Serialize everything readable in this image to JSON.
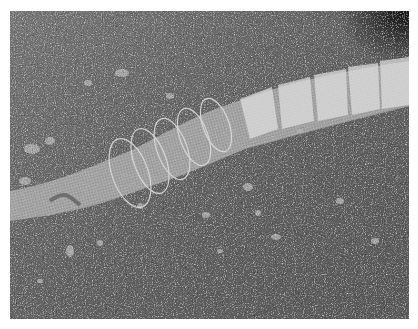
{
  "image": {
    "description": "Grayscale photograph of a collapsible mesh fish trap (fyke net) lying diagonally across gravel ground",
    "subject": "mesh fish trap",
    "background": "gravel and small stones",
    "colors": {
      "border": "#ffffff",
      "gravel_dark": "#4a4a4a",
      "gravel_mid": "#6e6e6e",
      "gravel_light": "#9a9a9a",
      "net": "#bdbdbd",
      "net_highlight": "#e6e6e6",
      "shadow_corner": "#1e1e1e"
    }
  }
}
